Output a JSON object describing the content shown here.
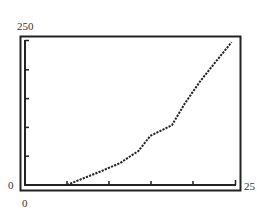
{
  "chart_data": {
    "type": "line",
    "title": "",
    "xlabel": "",
    "ylabel": "",
    "xlim": [
      0,
      25
    ],
    "ylim": [
      0,
      250
    ],
    "x_tick_step": 5,
    "y_tick_step": 50,
    "grid": false,
    "legend": null,
    "tick_labels": {
      "y_max": "250",
      "y_min": "0",
      "x_min": "0",
      "x_max": "25"
    },
    "series": [
      {
        "name": "curve",
        "style": "dotted",
        "color": "#222222",
        "x": [
          5.0,
          6.5,
          8.9,
          11.3,
          13.5,
          14.9,
          17.5,
          19.0,
          20.8,
          22.6,
          24.6
        ],
        "y": [
          0,
          9,
          23,
          38,
          59,
          85,
          104,
          141,
          179,
          212,
          248
        ]
      }
    ]
  },
  "labels": {
    "y_max": "250",
    "y_min": "0",
    "x_min": "0",
    "x_max": "25"
  }
}
